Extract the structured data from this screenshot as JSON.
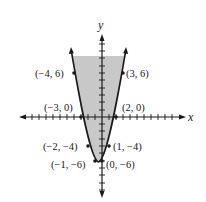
{
  "figure": {
    "type": "graph-of-inequality",
    "inequality": "y >= x^2 + x - 6",
    "axes": {
      "x_label": "x",
      "y_label": "y"
    },
    "colors": {
      "shade": "#c8c8c8",
      "curve": "#1a1a1a",
      "axis": "#1a1a1a"
    },
    "points": [
      {
        "x": -4,
        "y": 6,
        "label": "(−4, 6)"
      },
      {
        "x": 3,
        "y": 6,
        "label": "(3, 6)"
      },
      {
        "x": -3,
        "y": 0,
        "label": "(−3, 0)"
      },
      {
        "x": 2,
        "y": 0,
        "label": "(2, 0)"
      },
      {
        "x": -2,
        "y": -4,
        "label": "(−2, −4)"
      },
      {
        "x": 1,
        "y": -4,
        "label": "(1, −4)"
      },
      {
        "x": -1,
        "y": -6,
        "label": "(−1, −6)"
      },
      {
        "x": 0,
        "y": -6,
        "label": "(0, −6)"
      }
    ]
  }
}
